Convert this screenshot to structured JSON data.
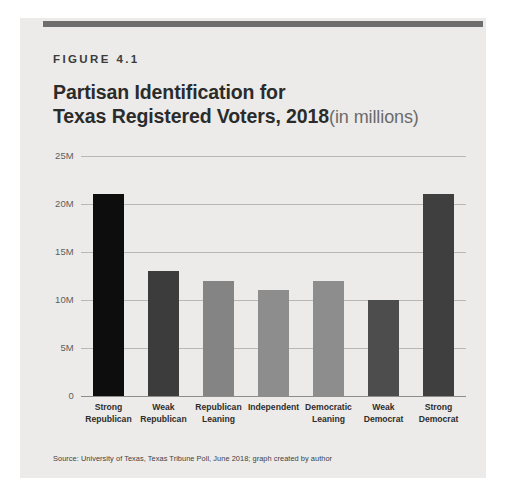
{
  "figure": {
    "eyebrow": "FIGURE 4.1",
    "title_line1": "Partisan Identification for",
    "title_line2": "Texas Registered Voters, 2018",
    "title_suffix": "(in millions)",
    "source": "Source: University of Texas, Texas Tribune Poll, June 2018; graph created by author"
  },
  "colors": {
    "card_background": "#ecebe9",
    "top_rule": "#6e6e6e",
    "gridline": "#b9b8b6",
    "axis": "#8e8d8b",
    "title_text": "#2b2b2b",
    "title_suffix_text": "#6a6a6a"
  },
  "chart_data": {
    "type": "bar",
    "xlabel": "",
    "ylabel": "",
    "ylim": [
      0,
      25
    ],
    "yticks": [
      0,
      5,
      10,
      15,
      20,
      25
    ],
    "ytick_labels": [
      "0",
      "5M",
      "10M",
      "15M",
      "20M",
      "25M"
    ],
    "grid": true,
    "legend": false,
    "units": "millions",
    "categories": [
      "Strong Republican",
      "Weak Republican",
      "Republican Leaning",
      "Independent",
      "Democratic Leaning",
      "Weak Democrat",
      "Strong Democrat"
    ],
    "category_lines": [
      [
        "Strong",
        "Republican"
      ],
      [
        "Weak",
        "Republican"
      ],
      [
        "Republican",
        "Leaning"
      ],
      [
        "Independent",
        ""
      ],
      [
        "Democratic",
        "Leaning"
      ],
      [
        "Weak",
        "Democrat"
      ],
      [
        "Strong",
        "Democrat"
      ]
    ],
    "values": [
      21,
      13,
      12,
      11,
      12,
      10,
      21
    ],
    "bar_colors": [
      "#0d0d0d",
      "#3c3c3c",
      "#848484",
      "#8d8d8d",
      "#8d8d8d",
      "#4d4d4d",
      "#3f3f3f"
    ]
  }
}
